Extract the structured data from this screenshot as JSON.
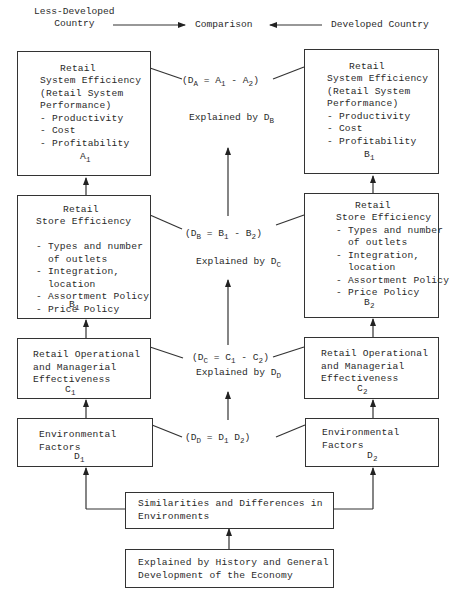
{
  "header": {
    "left": "Less-Developed\nCountry",
    "center": "Comparison",
    "right": "Developed Country"
  },
  "boxes": {
    "a1": {
      "title": "Retail",
      "lines": "System Efficiency\n(Retail System\nPerformance)\n- Productivity\n- Cost\n- Profitability",
      "symbol": "A",
      "subscript": "1"
    },
    "b1_right": {
      "title": "Retail",
      "lines": "System Efficiency\n(Retail System\nPerformance)\n- Productivity\n- Cost\n- Profitability",
      "symbol": "B",
      "subscript": "1"
    },
    "b1_left": {
      "title": "Retail",
      "lines": "Store Efficiency\n\n- Types and number\n  of outlets\n- Integration,\n  location\n- Assortment Policy\n- Price Policy",
      "symbol": "B",
      "subscript": "1"
    },
    "b2": {
      "title": "Retail",
      "lines": "Store Efficiency\n- Types and number\n  of outlets\n- Integration,\n  location\n- Assortment Policy\n- Price Policy",
      "symbol": "B",
      "subscript": "2"
    },
    "c1": {
      "lines": "Retail Operational\nand Managerial\nEffectiveness",
      "symbol": "C",
      "subscript": "1"
    },
    "c2": {
      "lines": "Retail Operational\nand Managerial\nEffectiveness",
      "symbol": "C",
      "subscript": "2"
    },
    "d1": {
      "lines": "Environmental\nFactors",
      "symbol": "D",
      "subscript": "1"
    },
    "d2": {
      "lines": "Environmental\nFactors",
      "symbol": "D",
      "subscript": "2"
    },
    "similarities": {
      "lines": "Similarities and Differences in\nEnvironments"
    },
    "history": {
      "lines": "Explained by History and General\nDevelopment of the Economy"
    }
  },
  "comparisons": {
    "da": {
      "lhs": "(D",
      "lhs_sub": "A",
      "eq": " = A",
      "s1": "1",
      "mid": " - A",
      "s2": "2",
      "end": ")",
      "explained": "Explained by D",
      "explained_sub": "B"
    },
    "db": {
      "lhs": "(D",
      "lhs_sub": "B",
      "eq": " = B",
      "s1": "1",
      "mid": " - B",
      "s2": "2",
      "end": ")",
      "explained": "Explained by D",
      "explained_sub": "C"
    },
    "dc": {
      "lhs": "(D",
      "lhs_sub": "C",
      "eq": " = C",
      "s1": "1",
      "mid": " - C",
      "s2": "2",
      "end": ")",
      "explained": "Explained by D",
      "explained_sub": "D"
    },
    "dd": {
      "lhs": "(D",
      "lhs_sub": "D",
      "eq": " = D",
      "s1": "1",
      "mid": " D",
      "s2": "2",
      "end": ")"
    }
  }
}
